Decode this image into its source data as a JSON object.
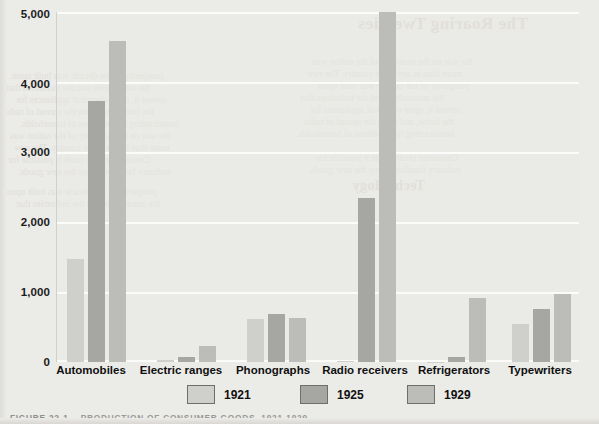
{
  "chart_data": {
    "type": "bar",
    "title": "",
    "xlabel": "",
    "ylabel": "Thousands",
    "ylim": [
      0,
      5000
    ],
    "yticks": [
      0,
      1000,
      2000,
      3000,
      4000,
      5000
    ],
    "ytick_labels": [
      "0",
      "1,000",
      "2,000",
      "3,000",
      "4,000",
      "5,000"
    ],
    "grid": true,
    "legend_position": "bottom",
    "categories": [
      "Automobiles",
      "Electric ranges",
      "Phonographs",
      "Radio receivers",
      "Refrigerators",
      "Typewriters"
    ],
    "series": [
      {
        "name": "1921",
        "color": "#cfcfcb",
        "values": [
          1470,
          25,
          610,
          10,
          5,
          545
        ]
      },
      {
        "name": "1925",
        "color": "#a6a6a2",
        "values": [
          3735,
          75,
          680,
          2350,
          75,
          755
        ]
      },
      {
        "name": "1929",
        "color": "#bcbcb8",
        "values": [
          4590,
          225,
          625,
          5000,
          920,
          975
        ]
      }
    ]
  },
  "figure": {
    "caption_number": "FIGURE 22-1",
    "caption_text": "PRODUCTION OF CONSUMER GOODS, 1921-1929",
    "caption_full": "FIGURE 22-1   PRODUCTION OF CONSUMER GOODS, 1921-1929"
  },
  "bleed_through": {
    "title": "The Roaring Twenties",
    "lines": [
      "the war on the economy of the nation was",
      "more than in any other country. The new",
      "prosperity of the decade was built upon",
      "the automobile and the industries that",
      "served it, upon electrical appliances for",
      "the home, and upon the spread of radio",
      "broadcasting into millions of households.",
      "Consumer credit made it possible for",
      "ordinary families to buy the new goods."
    ],
    "heading_2": "Technology"
  }
}
